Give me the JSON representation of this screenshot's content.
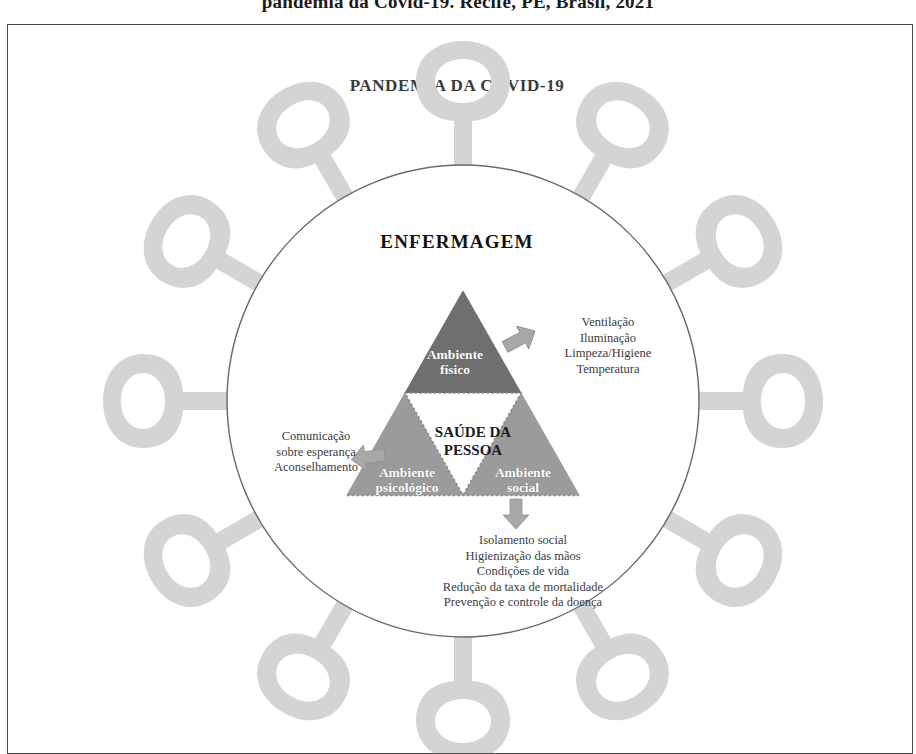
{
  "caption": {
    "top_line": "pandemia da Covid-19. Recife, PE, Brasil, 2021"
  },
  "figure": {
    "title": "PANDEMIA DA COVID-19",
    "center_ring_label": "ENFERMAGEM",
    "core_label_line1": "SAÚDE DA",
    "core_label_line2": "PESSOA"
  },
  "triangles": {
    "top": {
      "label_line1": "Ambiente",
      "label_line2": "físico",
      "fill": "#6f6f6f"
    },
    "left": {
      "label_line1": "Ambiente",
      "label_line2": "psicológico",
      "fill": "#9b9b9b"
    },
    "right": {
      "label_line1": "Ambiente",
      "label_line2": "social",
      "fill": "#9b9b9b"
    }
  },
  "outcomes": {
    "fisico": [
      "Ventilação",
      "Iluminação",
      "Limpeza/Higiene",
      "Temperatura"
    ],
    "psicologico": [
      "Comunicação",
      "sobre esperança",
      "Aconselhamento"
    ],
    "social": [
      "Isolamento social",
      "Higienização das mãos",
      "Condições de vida",
      "Redução da taxa de mortalidade",
      "Prevenção e controle da doença"
    ]
  },
  "colors": {
    "frame_border": "#4a4a4a",
    "circle_stroke": "#6a6a6a",
    "spike_fill": "#d4d4d4",
    "arrow_fill": "#a8a8a8",
    "dotted_core_stroke": "#8a8a8a",
    "title_text": "#3a3a3a",
    "body_text": "#3b3b3b"
  }
}
